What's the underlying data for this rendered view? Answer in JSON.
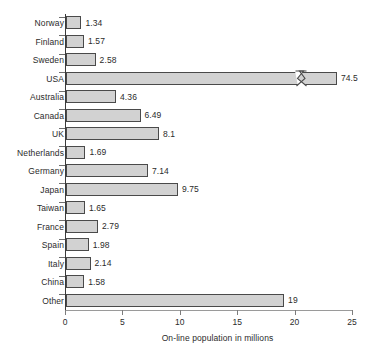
{
  "chart_data": {
    "type": "bar",
    "orientation": "horizontal",
    "title": "",
    "xlabel": "On-line population in millions",
    "ylabel": "",
    "xlim": [
      0,
      25
    ],
    "xticks": [
      0,
      5,
      10,
      15,
      20,
      25
    ],
    "xtick_labels": [
      "0",
      "5",
      "10",
      "15",
      "20",
      "25"
    ],
    "grid": false,
    "legend": null,
    "axis_break": {
      "series_index": 3,
      "category": "USA",
      "note": "zigzag break drawn on USA bar; true value 74.5 exceeds axis maximum of 25"
    },
    "categories": [
      "Norway",
      "Finland",
      "Sweden",
      "USA",
      "Australia",
      "Canada",
      "UK",
      "Netherlands",
      "Germany",
      "Japan",
      "Taiwan",
      "France",
      "Spain",
      "Italy",
      "China",
      "Other"
    ],
    "values": [
      1.34,
      1.57,
      2.58,
      74.5,
      4.36,
      6.49,
      8.1,
      1.69,
      7.14,
      9.75,
      1.65,
      2.79,
      1.98,
      2.14,
      1.58,
      19
    ],
    "value_labels": [
      "1.34",
      "1.57",
      "2.58",
      "74.5",
      "4.36",
      "6.49",
      "8.1",
      "1.69",
      "7.14",
      "9.75",
      "1.65",
      "2.79",
      "1.98",
      "2.14",
      "1.58",
      "19"
    ],
    "colors": {
      "bar_fill": "#d2d2d2",
      "bar_border": "#4a4a4a",
      "axis": "#3b3b3b",
      "text": "#2b2b2b",
      "background": "#ffffff"
    }
  }
}
